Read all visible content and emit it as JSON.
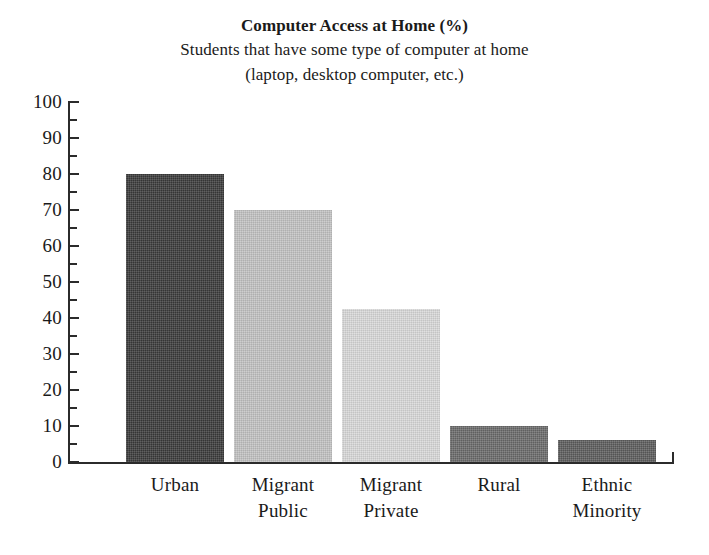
{
  "chart_data": {
    "type": "bar",
    "title": "Computer Access at Home (%)",
    "subtitle_line1": "Students that have some type of computer at home",
    "subtitle_line2": "(laptop, desktop computer, etc.)",
    "categories": [
      "Urban",
      "Migrant Public",
      "Migrant Private",
      "Rural",
      "Ethnic Minority"
    ],
    "category_lines": [
      [
        "Urban"
      ],
      [
        "Migrant",
        "Public"
      ],
      [
        "Migrant",
        "Private"
      ],
      [
        "Rural"
      ],
      [
        "Ethnic",
        "Minority"
      ]
    ],
    "values": [
      80,
      70,
      42.5,
      10,
      6
    ],
    "bar_colors": [
      "#3a3a3a",
      "#c2c2c2",
      "#d9d9d9",
      "#6a6a6a",
      "#5c5c5c"
    ],
    "xlabel": "",
    "ylabel": "",
    "ylim": [
      0,
      100
    ],
    "ytick_labels": [
      "100",
      "90",
      "80",
      "70",
      "60",
      "50",
      "40",
      "30",
      "20",
      "10",
      "0"
    ],
    "ytick_values": [
      100,
      90,
      80,
      70,
      60,
      50,
      40,
      30,
      20,
      10,
      0
    ],
    "minor_tick_step": 5,
    "grid": false,
    "legend": false
  }
}
